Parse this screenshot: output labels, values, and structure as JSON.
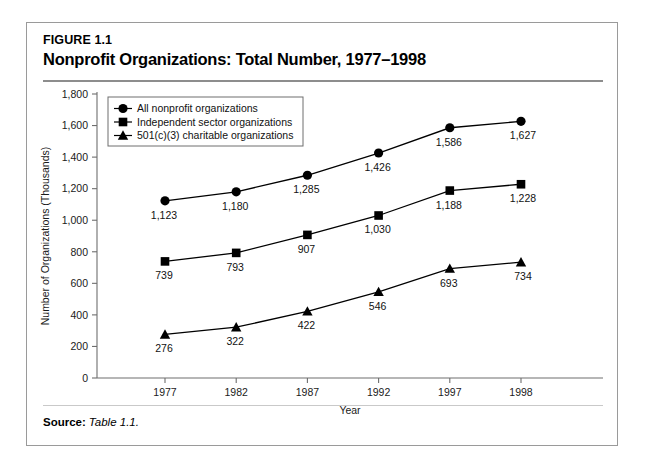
{
  "figure": {
    "label": "FIGURE 1.1",
    "title": "Nonprofit Organizations: Total Number, 1977–1998"
  },
  "source": {
    "label": "Source:",
    "value": "Table 1.1."
  },
  "chart_data": {
    "type": "line",
    "title": "Nonprofit Organizations: Total Number, 1977–1998",
    "xlabel": "Year",
    "ylabel": "Number of Organizations (Thousands)",
    "categories": [
      "1977",
      "1982",
      "1987",
      "1992",
      "1997",
      "1998"
    ],
    "ylim": [
      0,
      1800
    ],
    "yticks": [
      "0",
      "200",
      "400",
      "600",
      "800",
      "1,000",
      "1,200",
      "1,400",
      "1,600",
      "1,800"
    ],
    "ytick_values": [
      0,
      200,
      400,
      600,
      800,
      1000,
      1200,
      1400,
      1600,
      1800
    ],
    "grid": false,
    "legend_position": "upper-left inside plot",
    "series": [
      {
        "name": "All nonprofit organizations",
        "marker": "circle",
        "values": [
          1123,
          1180,
          1285,
          1426,
          1586,
          1627
        ],
        "labels": [
          "1,123",
          "1,180",
          "1,285",
          "1,426",
          "1,586",
          "1,627"
        ]
      },
      {
        "name": "Independent sector organizations",
        "marker": "square",
        "values": [
          739,
          793,
          907,
          1030,
          1188,
          1228
        ],
        "labels": [
          "739",
          "793",
          "907",
          "1,030",
          "1,188",
          "1,228"
        ]
      },
      {
        "name": "501(c)(3) charitable organizations",
        "marker": "triangle",
        "values": [
          276,
          322,
          422,
          546,
          693,
          734
        ],
        "labels": [
          "276",
          "322",
          "422",
          "546",
          "693",
          "734"
        ]
      }
    ]
  },
  "colors": {
    "ink": "#000000",
    "axis": "#6e6e6e",
    "frame": "#9a9a9a",
    "rule": "#8d8d8d",
    "background": "#ffffff"
  }
}
